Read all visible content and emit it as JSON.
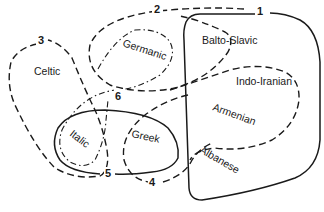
{
  "diagram": {
    "type": "isogloss-map",
    "groups": {
      "celtic": "Celtic",
      "germanic": "Germanic",
      "balto_slavic": "Balto-Slavic",
      "indo_iranian": "Indo-Iranian",
      "armenian": "Armenian",
      "albanese": "Albanese",
      "italic": "Italic",
      "greek": "Greek"
    },
    "isoglosses": {
      "l1": "1",
      "l2": "2",
      "l3": "3",
      "l4": "4",
      "l5": "5",
      "l6": "6"
    },
    "line_styles": {
      "1": "solid",
      "2": "dashed",
      "3": "dashed",
      "4": "dashed",
      "5": "solid",
      "6": "dash-dot"
    },
    "colors": {
      "ink": "#1a1a1a",
      "background": "#ffffff"
    }
  }
}
